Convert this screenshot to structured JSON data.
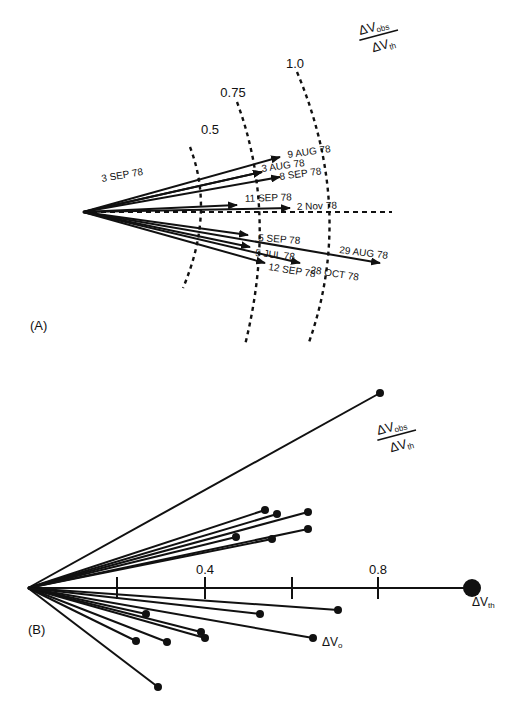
{
  "panelA": {
    "label": "(A)",
    "ratio_label": {
      "num": "ΔV",
      "num_sub": "obs",
      "den": "ΔV",
      "den_sub": "th"
    },
    "origin": [
      83,
      212
    ],
    "arcs": [
      {
        "value": "0.5",
        "label_pos": [
          210,
          134
        ],
        "path": "M190 147 Q 215 212 183 288"
      },
      {
        "value": "0.75",
        "label_pos": [
          233,
          97
        ],
        "path": "M237 102 Q 278 212 245 345"
      },
      {
        "value": "1.0",
        "label_pos": [
          295,
          68
        ],
        "path": "M297 72 Q 356 212 308 345"
      }
    ],
    "reference_line": {
      "x1": 83,
      "y1": 212,
      "x2": 392,
      "y2": 212
    },
    "arrows": [
      {
        "date": "9 AUG 78",
        "end": [
          280,
          157
        ],
        "label_pos": [
          288,
          158
        ],
        "rot": -8
      },
      {
        "date": "3 SEP 78",
        "end": [
          262,
          172
        ],
        "label_pos": [
          102,
          182
        ],
        "rot": -10
      },
      {
        "date": "3 AUG 78",
        "end": [
          262,
          172
        ],
        "label_pos": [
          262,
          172
        ],
        "rot": -8
      },
      {
        "date": "8 SEP 78",
        "end": [
          280,
          177
        ],
        "label_pos": [
          280,
          180
        ],
        "rot": -8
      },
      {
        "date": "11 SEP 78",
        "end": [
          237,
          205
        ],
        "label_pos": [
          245,
          202
        ],
        "rot": -2
      },
      {
        "date": "2 Nov 78",
        "end": [
          290,
          208
        ],
        "label_pos": [
          297,
          210
        ],
        "rot": -2
      },
      {
        "date": "5 SEP 78",
        "end": [
          248,
          235
        ],
        "label_pos": [
          258,
          241
        ],
        "rot": 4
      },
      {
        "date": "5 JUL 78",
        "end": [
          250,
          247
        ],
        "label_pos": [
          255,
          256
        ],
        "rot": 6
      },
      {
        "date": "29 AUG 78",
        "end": [
          380,
          263
        ],
        "label_pos": [
          339,
          253
        ],
        "rot": 7
      },
      {
        "date": "12 SEP 78",
        "end": [
          265,
          263
        ],
        "label_pos": [
          268,
          270
        ],
        "rot": 9
      },
      {
        "date": "28 OCT 78",
        "end": [
          300,
          263
        ],
        "label_pos": [
          310,
          273
        ],
        "rot": 9
      }
    ]
  },
  "panelB": {
    "label": "(B)",
    "ratio_label": {
      "num": "ΔV",
      "num_sub": "obs",
      "den": "ΔV",
      "den_sub": "th"
    },
    "origin": [
      28,
      588
    ],
    "axis": {
      "x_end": 294,
      "ticks": [
        117,
        205,
        292,
        378
      ],
      "tick_labels": [
        {
          "text": "0.4",
          "x": 205
        },
        {
          "text": "0.8",
          "x": 378
        }
      ]
    },
    "large_dot": {
      "pos": [
        294,
        588
      ],
      "label": "ΔV",
      "label_sub": "th"
    },
    "vectors_upper": [
      [
        380,
        393
      ],
      [
        265,
        510
      ],
      [
        277,
        514
      ],
      [
        308,
        512
      ],
      [
        308,
        529
      ],
      [
        236,
        537
      ],
      [
        272,
        539
      ]
    ],
    "vectors_lower": [
      [
        338,
        610
      ],
      [
        260,
        614
      ],
      [
        146,
        614
      ],
      [
        201,
        632
      ],
      [
        205,
        638
      ],
      [
        136,
        641
      ],
      [
        167,
        642
      ],
      [
        313,
        638
      ],
      [
        158,
        687
      ]
    ],
    "vo_label": {
      "text": "ΔV",
      "sub": "o",
      "pos": [
        322,
        646
      ]
    }
  },
  "chart_data": {
    "type": "vector-diagram",
    "panels": [
      {
        "name": "A",
        "description": "Normalized voltage-change vectors (ΔV_obs/ΔV_th) by date, with iso-magnitude arcs",
        "axis_label": "ΔV_obs / ΔV_th",
        "arc_levels": [
          0.5,
          0.75,
          1.0
        ],
        "vectors": [
          {
            "date": "9 AUG 78",
            "magnitude": 0.92,
            "angle_deg": 16
          },
          {
            "date": "3 SEP 78",
            "magnitude": 0.84,
            "angle_deg": 12
          },
          {
            "date": "3 AUG 78",
            "magnitude": 0.84,
            "angle_deg": 12
          },
          {
            "date": "8 SEP 78",
            "magnitude": 0.92,
            "angle_deg": 10
          },
          {
            "date": "11 SEP 78",
            "magnitude": 0.72,
            "angle_deg": 3
          },
          {
            "date": "2 Nov 78",
            "magnitude": 0.96,
            "angle_deg": 1
          },
          {
            "date": "5 SEP 78",
            "magnitude": 0.76,
            "angle_deg": -8
          },
          {
            "date": "5 JUL 78",
            "magnitude": 0.77,
            "angle_deg": -12
          },
          {
            "date": "29 AUG 78",
            "magnitude": 1.4,
            "angle_deg": -10
          },
          {
            "date": "12 SEP 78",
            "magnitude": 0.84,
            "angle_deg": -17
          },
          {
            "date": "28 OCT 78",
            "magnitude": 1.0,
            "angle_deg": -15
          }
        ]
      },
      {
        "name": "B",
        "description": "Observed ΔV vectors normalized to ΔV_th, axis ticks 0.2 steps",
        "axis_ticks": [
          0.2,
          0.4,
          0.6,
          0.8,
          1.0
        ],
        "tick_labels": [
          "0.4",
          "0.8"
        ],
        "reference": "ΔV_th at 1.0",
        "annotated": "ΔV_o"
      }
    ]
  }
}
